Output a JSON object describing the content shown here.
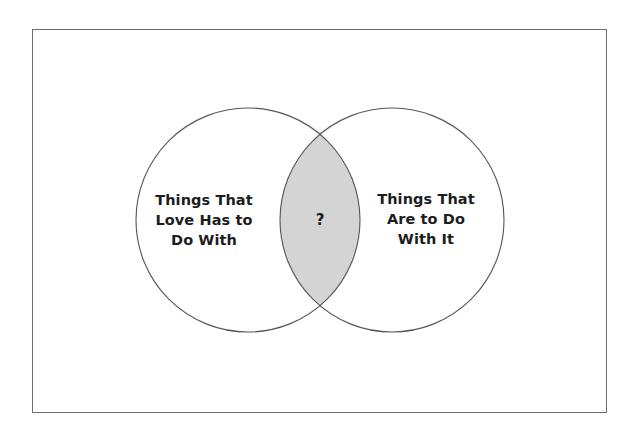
{
  "figure": {
    "type": "venn-diagram",
    "frame": {
      "border_color": "#6e6e6e",
      "background_color": "#ffffff"
    },
    "circles": [
      {
        "id": "left",
        "label": "Things That\nLove Has to\nDo With",
        "center_x": 248,
        "center_y": 220,
        "radius": 112,
        "stroke_color": "#555555",
        "fill_color": "#ffffff"
      },
      {
        "id": "right",
        "label": "Things That\nAre to Do\nWith It",
        "center_x": 392,
        "center_y": 220,
        "radius": 112,
        "stroke_color": "#555555",
        "fill_color": "#ffffff"
      }
    ],
    "overlap": {
      "label": "?",
      "center_x": 320,
      "center_y": 220,
      "fill_color": "#d4d4d4",
      "stroke_color": "#555555"
    }
  }
}
